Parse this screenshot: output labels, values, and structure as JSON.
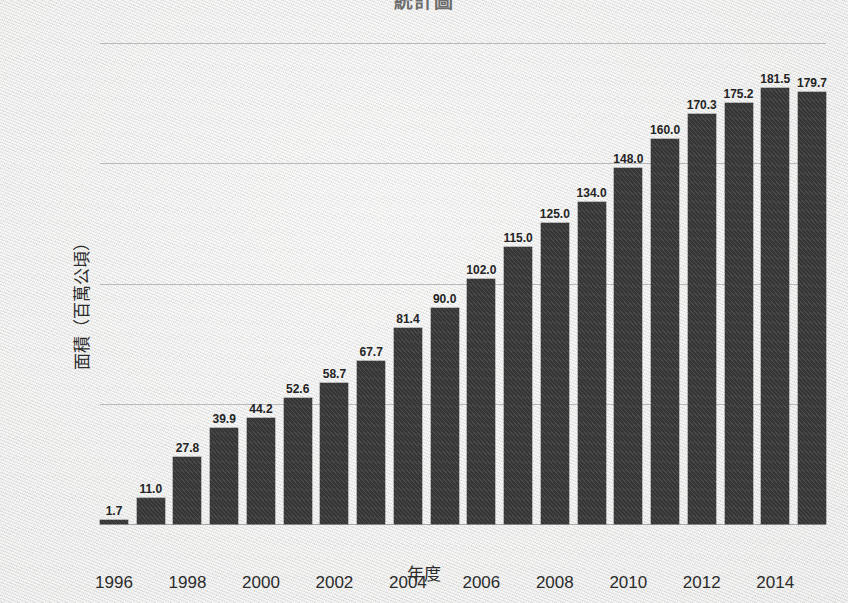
{
  "title_partial": "統計圖",
  "chart_data": {
    "type": "bar",
    "title": "",
    "xlabel": "年度",
    "ylabel": "面積（百萬公頃）",
    "categories": [
      "1996",
      "1997",
      "1998",
      "1999",
      "2000",
      "2001",
      "2002",
      "2003",
      "2004",
      "2005",
      "2006",
      "2007",
      "2008",
      "2009",
      "2010",
      "2011",
      "2012",
      "2013",
      "2014",
      "2015"
    ],
    "values": [
      1.7,
      11.0,
      27.8,
      39.9,
      44.2,
      52.6,
      58.7,
      67.7,
      81.4,
      90.0,
      102.0,
      115.0,
      125.0,
      134.0,
      148.0,
      160.0,
      170.3,
      175.2,
      181.5,
      179.7
    ],
    "value_labels": [
      "1.7",
      "11.0",
      "27.8",
      "39.9",
      "44.2",
      "52.6",
      "58.7",
      "67.7",
      "81.4",
      "90.0",
      "102.0",
      "115.0",
      "125.0",
      "134.0",
      "148.0",
      "160.0",
      "170.3",
      "175.2",
      "181.5",
      "179.7"
    ],
    "ylim": [
      0,
      200
    ],
    "yticks": [
      0,
      50,
      100,
      150,
      200
    ],
    "ytick_labels": [
      "0",
      "50",
      "100",
      "150",
      "200"
    ],
    "xtick_labels": [
      "1996",
      "1998",
      "2000",
      "2002",
      "2004",
      "2006",
      "2008",
      "2010",
      "2012",
      "2014"
    ],
    "xtick_categories": [
      "1996",
      "1998",
      "2000",
      "2002",
      "2004",
      "2006",
      "2008",
      "2010",
      "2012",
      "2014"
    ],
    "grid": true,
    "legend": null,
    "bar_color": "#3c3c3c",
    "grid_color": "#b9b9b9",
    "background_color": "#ededec"
  }
}
